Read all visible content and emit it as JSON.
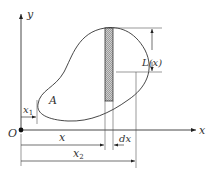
{
  "diagram": {
    "axes": {
      "x_label": "x",
      "y_label": "y",
      "origin_label": "O"
    },
    "region_label": "A",
    "strip_height_label": "L(x)",
    "dimensions": {
      "x1": "x",
      "x1_sub": "1",
      "x": "x",
      "dx": "dx",
      "x2": "x",
      "x2_sub": "2"
    },
    "colors": {
      "stroke": "#333333",
      "hatch": "#888888",
      "background": "#ffffff"
    }
  }
}
